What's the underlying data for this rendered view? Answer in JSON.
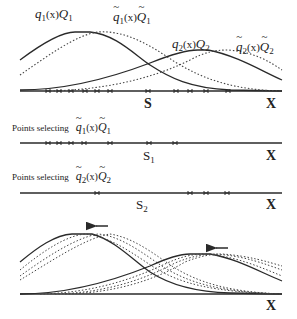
{
  "panel_top": {
    "labels": {
      "q1Q1": {
        "q": "q",
        "sub1": "1",
        "mid": "(x)",
        "Q": "Q",
        "sub2": "1"
      },
      "q1Q1_tilde": {
        "q": "q",
        "sub1": "1",
        "mid": "(x)",
        "Q": "Q",
        "sub2": "1"
      },
      "q2Q2": {
        "q": "q",
        "sub1": "2",
        "mid": "(x)",
        "Q": "Q",
        "sub2": "2"
      },
      "q2Q2_tilde": {
        "q": "q",
        "sub1": "2",
        "mid": "(x)",
        "Q": "Q",
        "sub2": "2"
      }
    },
    "axis_split_label": "S",
    "axis_end_label": "X",
    "sample_points_x": [
      48,
      59,
      71,
      85,
      97,
      110,
      148,
      176,
      190,
      206,
      228
    ]
  },
  "panel_s1": {
    "caption": "Points selecting",
    "caption_math": {
      "q": "q",
      "sub1": "1",
      "mid": "(x)",
      "Q": "Q",
      "sub2": "1"
    },
    "axis_split_label": "S",
    "axis_split_sub": "1",
    "axis_end_label": "X",
    "sample_points_x": [
      48,
      59,
      71,
      84,
      110,
      149,
      175
    ]
  },
  "panel_s2": {
    "caption": "Points selecting",
    "caption_math": {
      "q": "q",
      "sub1": "2",
      "mid": "(x)",
      "Q": "Q",
      "sub2": "2"
    },
    "axis_split_label": "S",
    "axis_split_sub": "2",
    "axis_end_label": "X",
    "sample_points_x": [
      97,
      190,
      206,
      227
    ]
  },
  "panel_bottom": {
    "axis_end_label": "X",
    "arrow_direction": "left"
  },
  "colors": {
    "line": "#2a2a2a",
    "dotted": "#444444",
    "background": "#ffffff"
  }
}
